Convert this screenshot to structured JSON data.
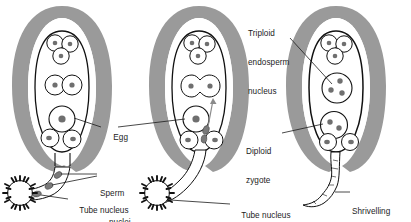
{
  "figure": {
    "type": "biological-diagram",
    "panel_count": 3,
    "palette": {
      "outline": "#111111",
      "integument_gray": "#9a9a9a",
      "nucleus_gray": "#6f6f6f",
      "sperm_nucleus_gray": "#7a7a7a",
      "background": "#ffffff",
      "pollen_grain": "#111111",
      "leader_line": "#1c1c1c"
    }
  },
  "panels": [
    {
      "id": "panel-1",
      "name": "pollen-tube-arrival",
      "stage": "Pollen tube reaches the embryo sac",
      "labels": [
        {
          "id": "egg",
          "text": "Egg"
        },
        {
          "id": "sperm-nuclei",
          "line1": "Sperm",
          "line2": "nuclei"
        },
        {
          "id": "tube-nucleus",
          "text": "Tube nucleus"
        }
      ],
      "structures": {
        "antipodal_cells": 3,
        "polar_nuclei": 2,
        "egg_cell": 1,
        "synergids": 2,
        "sperm_nuclei_in_tube": 2,
        "tube_nucleus_in_tube": 1,
        "pollen_grain": 1
      }
    },
    {
      "id": "panel-2",
      "name": "fusion-of-nuclei",
      "stage": "Sperm nuclei released; fusion occurs",
      "labels": [
        {
          "id": "tube-nucleus",
          "text": "Tube nucleus"
        }
      ],
      "structures": {
        "antipodal_cells": 3,
        "fusing_polar_nuclei": 2,
        "egg_cell": 1,
        "synergids": 2,
        "released_sperm_nuclei": 2,
        "tube_nucleus_in_tube": 1,
        "pollen_grain": 1,
        "arrow": "sperm nucleus travelling to polar nuclei"
      }
    },
    {
      "id": "panel-3",
      "name": "after-fertilisation",
      "stage": "After double fertilisation",
      "labels": [
        {
          "id": "triploid-endosperm-nucleus",
          "line1": "Triploid",
          "line2": "endosperm",
          "line3": "nucleus"
        },
        {
          "id": "diploid-zygote",
          "line1": "Diploid",
          "line2": "zygote"
        },
        {
          "id": "shrivelling-pollen-tube",
          "line1": "Shrivelling",
          "line2": "pollen tube"
        }
      ],
      "structures": {
        "antipodal_cells": 3,
        "triploid_endosperm_nucleus_dots": 3,
        "diploid_zygote_dots": 2,
        "synergids": 2,
        "shrivelled_pollen_tube": 1
      }
    }
  ]
}
